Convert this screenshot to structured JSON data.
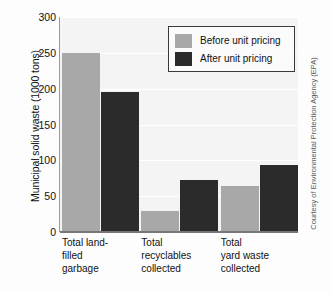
{
  "chart_data": {
    "type": "bar",
    "title": "",
    "xlabel": "",
    "ylabel": "Municipal solid waste (1000 tons)",
    "ylim": [
      0,
      300
    ],
    "yticks": [
      0,
      50,
      100,
      150,
      200,
      250,
      300
    ],
    "ytick_labels": [
      "0",
      "50",
      "100",
      "150",
      "200",
      "250",
      "300"
    ],
    "grid": true,
    "legend_position": "top-right",
    "categories": [
      "Total land-\nfilled\ngarbage",
      "Total\nrecyclables\ncollected",
      "Total\nyard waste\ncollected"
    ],
    "series": [
      {
        "name": "Before unit pricing",
        "color": "#a8a8a8",
        "values": [
          250,
          30,
          64
        ]
      },
      {
        "name": "After unit pricing",
        "color": "#2b2b2b",
        "values": [
          196,
          73,
          94
        ]
      }
    ],
    "annotations": [
      "Courtesy of Environmental Protection Agency (EPA)"
    ]
  },
  "legend": {
    "items": [
      {
        "label": "Before unit pricing"
      },
      {
        "label": "After unit pricing"
      }
    ]
  },
  "credit": {
    "text": "Courtesy of Environmental Protection Agency (EPA)"
  }
}
